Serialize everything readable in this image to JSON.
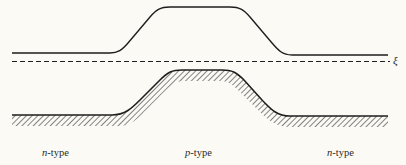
{
  "diagram": {
    "type": "energy-band-diagram",
    "fermi_level": {
      "symbol": "ξ",
      "style": "dashed"
    },
    "regions": [
      {
        "label_prefix": "n",
        "label_suffix": "-type"
      },
      {
        "label_prefix": "p",
        "label_suffix": "-type"
      },
      {
        "label_prefix": "n",
        "label_suffix": "-type"
      }
    ],
    "curves": {
      "upper_band": {
        "style": "solid",
        "shape": "raised plateau in p-region"
      },
      "lower_band": {
        "style": "solid with hatching below",
        "shape": "raised plateau in p-region"
      }
    },
    "colors": {
      "line": "#1e1e1e",
      "background": "#fbfaf5"
    }
  }
}
